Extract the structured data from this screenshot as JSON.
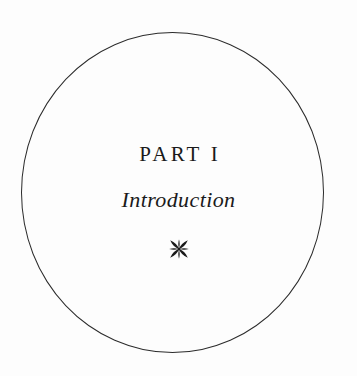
{
  "page": {
    "kind": "book-part-title-page",
    "background_color": "#fdfdfd",
    "ink_color": "#1a1a1a"
  },
  "frame": {
    "shape": "circle",
    "name": "decorative-circle-rule",
    "stroke_color": "#2b2b2b",
    "stroke_width_px": 1.1
  },
  "title_block": {
    "part_label": "PART I",
    "subtitle": "Introduction",
    "ornament_name": "four-petal-fleuron-ornament",
    "ornament_color": "#1a1a1a"
  }
}
